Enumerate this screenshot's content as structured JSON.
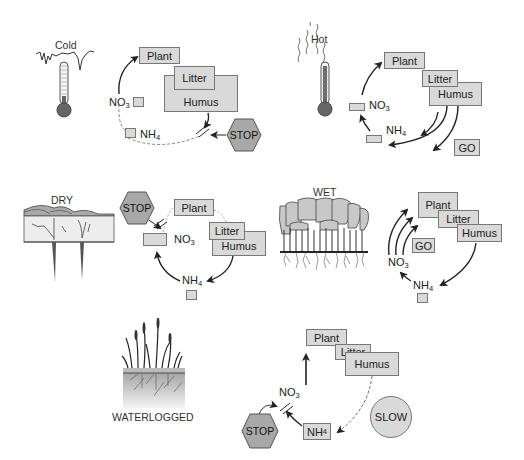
{
  "panels": {
    "cold": {
      "condition_label": "Cold",
      "icon": "thermometer-low-icon",
      "boxes": {
        "plant": "Plant",
        "litter": "Litter",
        "humus": "Humus"
      },
      "species": {
        "no3": "NO",
        "no3_sub": "3",
        "nh4": "NH",
        "nh4_sub": "4"
      },
      "signal": "STOP"
    },
    "hot": {
      "condition_label": "Hot",
      "icon": "thermometer-high-icon",
      "boxes": {
        "plant": "Plant",
        "litter": "Litter",
        "humus": "Humus"
      },
      "species": {
        "no3": "NO",
        "no3_sub": "3",
        "nh4": "NH",
        "nh4_sub": "4"
      },
      "signal": "GO"
    },
    "dry": {
      "condition_label": "DRY",
      "icon": "dry-soil-icon",
      "boxes": {
        "plant": "Plant",
        "litter": "Litter",
        "humus": "Humus"
      },
      "species": {
        "no3": "NO",
        "no3_sub": "3",
        "nh4": "NH",
        "nh4_sub": "4"
      },
      "signal": "STOP"
    },
    "wet": {
      "condition_label": "WET",
      "icon": "wet-forest-icon",
      "boxes": {
        "plant": "Plant",
        "litter": "Litter",
        "humus": "Humus"
      },
      "species": {
        "no3": "NO",
        "no3_sub": "3",
        "nh4": "NH",
        "nh4_sub": "4"
      },
      "signal": "GO"
    },
    "waterlogged": {
      "condition_label": "WATERLOGGED",
      "icon": "waterlogged-marsh-icon",
      "boxes": {
        "plant": "Plant",
        "litter": "Litter",
        "humus": "Humus"
      },
      "species": {
        "no3": "NO",
        "no3_sub": "3",
        "nh4": "NH",
        "nh4_sub": "4"
      },
      "signal": "STOP",
      "rate": "SLOW"
    }
  },
  "colors": {
    "box_fill": "#d9d9d9",
    "box_border": "#777777",
    "stop_fill": "#a8a8a8",
    "arrow": "#222222",
    "background": "#ffffff"
  }
}
